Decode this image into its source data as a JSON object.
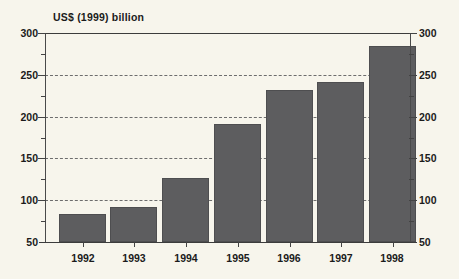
{
  "chart_data": {
    "type": "bar",
    "title": "US$ (1999) billion",
    "xlabel": "",
    "ylabel": "",
    "categories": [
      "1992",
      "1993",
      "1994",
      "1995",
      "1996",
      "1997",
      "1998"
    ],
    "values": [
      83,
      92,
      127,
      191,
      232,
      241,
      285
    ],
    "ylim": [
      50,
      300
    ],
    "y_ticks_major": [
      50,
      100,
      150,
      200,
      250,
      300
    ],
    "y_ticks_minor": [
      75,
      125,
      175,
      225,
      275
    ],
    "y_tick_labels_left": [
      "300",
      "250",
      "200",
      "150",
      "100",
      "50"
    ],
    "y_tick_labels_right": [
      "300",
      "250",
      "200",
      "150",
      "100",
      "50"
    ],
    "gridlines_at": [
      100,
      150,
      200,
      250
    ],
    "grid": "horizontal-dashed",
    "legend": "none",
    "legend_position": "none",
    "bar_color": "#5d5d5f",
    "background_color": "#f7f5ec",
    "axis_color": "#3c3c3c",
    "dual_y_axis": true,
    "annotations": []
  }
}
